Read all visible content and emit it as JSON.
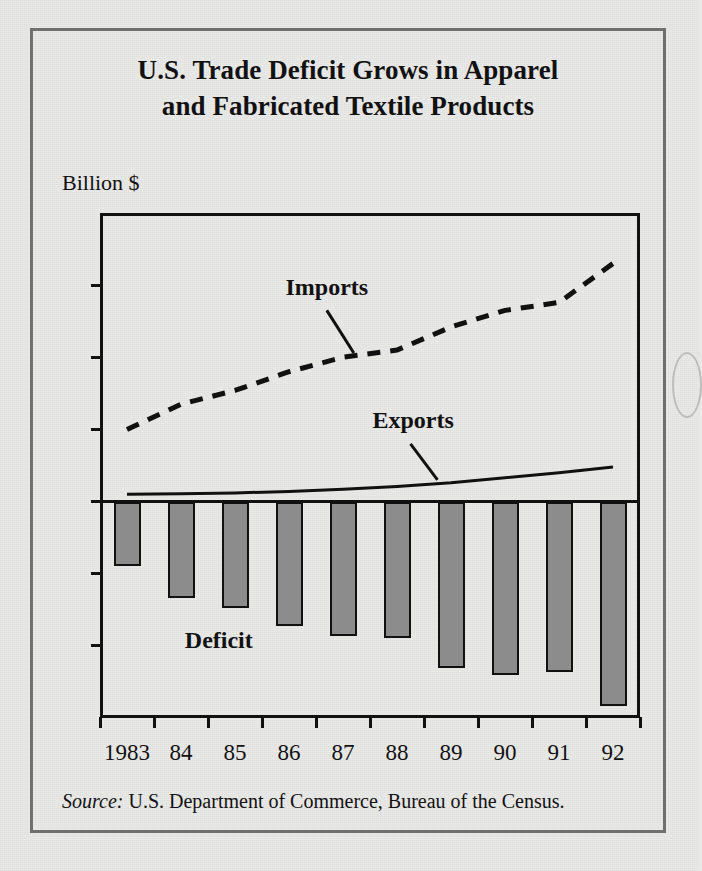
{
  "figure": {
    "title_line1": "U.S. Trade Deficit Grows in Apparel",
    "title_line2": "and Fabricated Textile Products",
    "source_prefix": "Source:",
    "source_text": " U.S. Department of Commerce, Bureau of the Census."
  },
  "chart_data": {
    "type": "bar",
    "title": "U.S. Trade Deficit Grows in Apparel and Fabricated Textile Products",
    "subtitle": "",
    "xlabel": "",
    "ylabel": "Billion $",
    "ylim": [
      -30,
      40
    ],
    "yticks": [
      40,
      30,
      20,
      10,
      0,
      -10,
      -20,
      -30
    ],
    "ytick_labels": [
      "40",
      "30",
      "20",
      "10",
      "0",
      "-10",
      "-20",
      "-30"
    ],
    "grid": false,
    "legend_position": "inline-annotations",
    "categories": [
      "1983",
      "84",
      "85",
      "86",
      "87",
      "88",
      "89",
      "90",
      "91",
      "92"
    ],
    "x": [
      1983,
      1984,
      1985,
      1986,
      1987,
      1988,
      1989,
      1990,
      1991,
      1992
    ],
    "series": [
      {
        "name": "Deficit",
        "render": "bar",
        "color": "#8c8c8c",
        "values": [
          -9.0,
          -13.3,
          -14.8,
          -17.2,
          -18.6,
          -18.9,
          -23.1,
          -24.0,
          -23.6,
          -28.4
        ]
      },
      {
        "name": "Imports",
        "render": "dashed-line",
        "color": "#111111",
        "values": [
          10.0,
          13.5,
          15.4,
          18.0,
          20.0,
          21.0,
          24.2,
          26.5,
          27.6,
          33.0
        ]
      },
      {
        "name": "Exports",
        "render": "solid-line",
        "color": "#111111",
        "values": [
          1.0,
          1.1,
          1.2,
          1.4,
          1.7,
          2.1,
          2.6,
          3.3,
          4.0,
          4.8
        ]
      }
    ],
    "annotations": [
      {
        "text": "Imports",
        "x_frac": 0.42,
        "y_value": 29.5
      },
      {
        "text": "Exports",
        "x_frac": 0.58,
        "y_value": 11.0
      },
      {
        "text": "Deficit",
        "x_frac": 0.22,
        "y_value": -19.5
      }
    ]
  },
  "axis_labels": {
    "y_unit": "Billion $"
  }
}
